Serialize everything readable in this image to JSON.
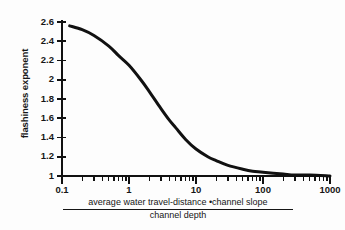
{
  "figure": {
    "background_color": "#fdfdfd",
    "ink_color": "#111111"
  },
  "axes": {
    "y": {
      "title": "flashiness exponent",
      "tick_labels": [
        "2.6",
        "2.4",
        "2.2",
        "2",
        "1.8",
        "1.6",
        "1.4",
        "1.2",
        "1"
      ],
      "min": 1,
      "max": 2.6
    },
    "x": {
      "scale": "log",
      "tick_labels": [
        "0.1",
        "1",
        "10",
        "100",
        "1000"
      ],
      "min": 0.1,
      "max": 1000,
      "caption_numerator": "average water travel-distance •channel slope",
      "caption_denominator": "channel depth"
    }
  },
  "chart_data": {
    "type": "line",
    "title": "",
    "xlabel": "average water travel-distance •channel slope / channel depth",
    "ylabel": "flashiness exponent",
    "xscale": "log",
    "xlim": [
      0.1,
      1000
    ],
    "ylim": [
      1,
      2.6
    ],
    "grid": false,
    "legend": "none",
    "xticks": [
      0.1,
      1,
      10,
      100,
      1000
    ],
    "xtick_labels": [
      "0.1",
      "1",
      "10",
      "100",
      "1000"
    ],
    "yticks": [
      1,
      1.2,
      1.4,
      1.6,
      1.8,
      2,
      2.2,
      2.4,
      2.6
    ],
    "ytick_labels": [
      "1",
      "1.2",
      "1.4",
      "1.6",
      "1.8",
      "2",
      "2.2",
      "2.4",
      "2.6"
    ],
    "series": [
      {
        "name": "flashiness exponent",
        "color": "#111111",
        "line_width": 3,
        "x": [
          0.13,
          0.2,
          0.3,
          0.5,
          0.7,
          1.0,
          1.5,
          2.0,
          3.0,
          4.0,
          5.0,
          7.0,
          10.0,
          15.0,
          20.0,
          30.0,
          50.0,
          70.0,
          100.0,
          200.0,
          300.0,
          500.0,
          1000.0
        ],
        "values": [
          2.56,
          2.52,
          2.46,
          2.35,
          2.25,
          2.15,
          2.0,
          1.88,
          1.7,
          1.58,
          1.5,
          1.38,
          1.28,
          1.2,
          1.16,
          1.11,
          1.07,
          1.05,
          1.04,
          1.02,
          1.01,
          1.01,
          1.0
        ]
      }
    ]
  }
}
